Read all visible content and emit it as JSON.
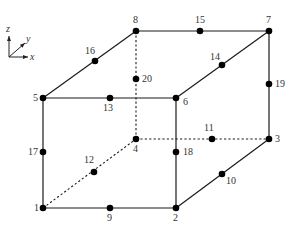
{
  "diagram": {
    "axes": {
      "origin": [
        9,
        57
      ],
      "x": {
        "label": "x",
        "end": [
          28,
          57
        ]
      },
      "y": {
        "label": "y",
        "end": [
          25,
          43
        ]
      },
      "z": {
        "label": "z",
        "end": [
          9,
          36
        ]
      }
    },
    "nodes": [
      {
        "id": "1",
        "x": 43,
        "y": 208,
        "lx": 34,
        "ly": 211
      },
      {
        "id": "2",
        "x": 176,
        "y": 208,
        "lx": 173,
        "ly": 221
      },
      {
        "id": "3",
        "x": 269,
        "y": 139,
        "lx": 275,
        "ly": 142
      },
      {
        "id": "4",
        "x": 136,
        "y": 139,
        "lx": 133,
        "ly": 152
      },
      {
        "id": "5",
        "x": 43,
        "y": 98,
        "lx": 33,
        "ly": 101
      },
      {
        "id": "6",
        "x": 176,
        "y": 98,
        "lx": 183,
        "ly": 105
      },
      {
        "id": "7",
        "x": 269,
        "y": 31,
        "lx": 266,
        "ly": 23
      },
      {
        "id": "8",
        "x": 136,
        "y": 31,
        "lx": 133,
        "ly": 23
      },
      {
        "id": "9",
        "x": 110,
        "y": 208,
        "lx": 107,
        "ly": 221
      },
      {
        "id": "10",
        "x": 222,
        "y": 174,
        "lx": 226,
        "ly": 184
      },
      {
        "id": "11",
        "x": 212,
        "y": 139,
        "lx": 204,
        "ly": 131
      },
      {
        "id": "12",
        "x": 94,
        "y": 172,
        "lx": 84,
        "ly": 163
      },
      {
        "id": "13",
        "x": 110,
        "y": 98,
        "lx": 103,
        "ly": 111
      },
      {
        "id": "14",
        "x": 222,
        "y": 65,
        "lx": 210,
        "ly": 60
      },
      {
        "id": "15",
        "x": 200,
        "y": 31,
        "lx": 195,
        "ly": 23
      },
      {
        "id": "16",
        "x": 95,
        "y": 61,
        "lx": 85,
        "ly": 54
      },
      {
        "id": "17",
        "x": 43,
        "y": 152,
        "lx": 28,
        "ly": 155
      },
      {
        "id": "18",
        "x": 176,
        "y": 152,
        "lx": 183,
        "ly": 155
      },
      {
        "id": "19",
        "x": 269,
        "y": 84,
        "lx": 275,
        "ly": 87
      },
      {
        "id": "20",
        "x": 136,
        "y": 79,
        "lx": 142,
        "ly": 82
      }
    ],
    "solid_edges": [
      [
        "1",
        "2"
      ],
      [
        "2",
        "3"
      ],
      [
        "3",
        "7"
      ],
      [
        "7",
        "8"
      ],
      [
        "8",
        "5"
      ],
      [
        "5",
        "1"
      ],
      [
        "5",
        "6"
      ],
      [
        "6",
        "7"
      ],
      [
        "6",
        "2"
      ]
    ],
    "hidden_edges": [
      [
        "1",
        "4"
      ],
      [
        "4",
        "3"
      ],
      [
        "4",
        "8"
      ]
    ],
    "colors": {
      "line": "#1a1a1a",
      "node": "#000000",
      "label": "#333333",
      "background": "#ffffff"
    }
  }
}
